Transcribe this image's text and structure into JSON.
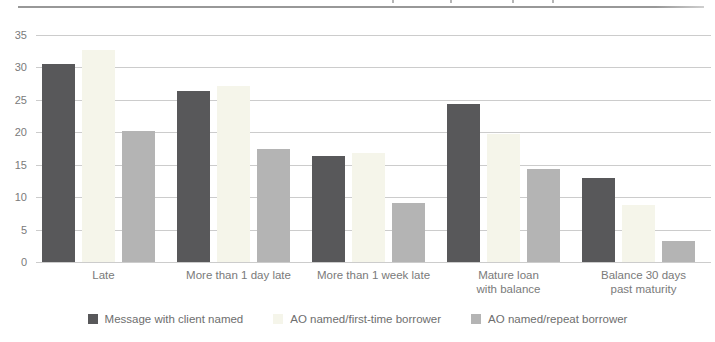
{
  "header": {
    "rule_color": "#989898"
  },
  "chart_data": {
    "type": "bar",
    "categories": [
      "Late",
      "More than 1 day late",
      "More than 1 week late",
      "Mature loan\nwith balance",
      "Balance 30 days\npast maturity"
    ],
    "series": [
      {
        "name": "Message with client named",
        "color": "#58585a",
        "values": [
          30.6,
          26.4,
          16.3,
          24.3,
          12.9
        ]
      },
      {
        "name": "AO named/first-time borrower",
        "color": "#f5f5ea",
        "values": [
          32.7,
          27.1,
          16.8,
          19.8,
          8.8
        ]
      },
      {
        "name": "AO named/repeat borrower",
        "color": "#b4b4b4",
        "values": [
          20.2,
          17.4,
          9.1,
          14.3,
          3.2
        ]
      }
    ],
    "title": "",
    "xlabel": "",
    "ylabel": "",
    "ylim": [
      0,
      35
    ],
    "yticks": [
      0,
      5,
      10,
      15,
      20,
      25,
      30,
      35
    ],
    "grid": true,
    "legend_position": "bottom"
  },
  "colors": {
    "gridline": "#cccccc",
    "axis_text": "#7a7a7a",
    "legend_text": "#6e6e6e"
  }
}
